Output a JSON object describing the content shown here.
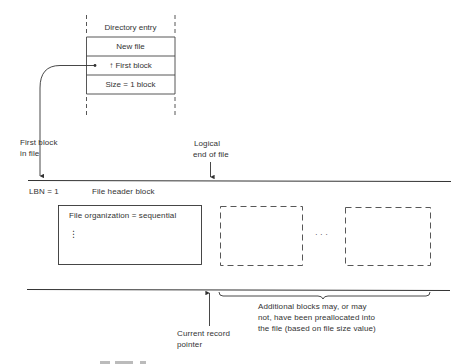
{
  "directory_entry": {
    "title": "Directory entry",
    "rows": [
      {
        "label": "New file"
      },
      {
        "label": "↑ First block"
      },
      {
        "label": "Size = 1 block"
      }
    ]
  },
  "labels": {
    "first_block": [
      "First block",
      "in file"
    ],
    "logical_eof": [
      "Logical",
      "end of file"
    ],
    "lbn": "LBN = 1",
    "header_block": "File header block",
    "current_record": [
      "Current record",
      "pointer"
    ],
    "additional_blocks": [
      "Additional blocks may, or may",
      "not, have been preallocated into",
      "the file (based on file size value)"
    ]
  },
  "header_box": {
    "text": "File organization = sequential",
    "ellipsis": "⋮"
  },
  "between_blocks_ellipsis": "· · ·",
  "colors": {
    "ink": "#333333",
    "background": "#ffffff"
  }
}
